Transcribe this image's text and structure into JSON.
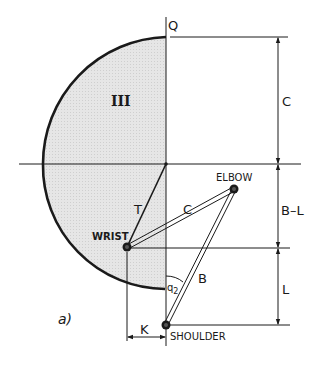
{
  "figure": {
    "panel_label": "a)",
    "region_label": "III",
    "points": {
      "Q": {
        "label": "Q",
        "x": 166,
        "y": 37
      },
      "origin": {
        "x": 166,
        "y": 164
      },
      "wrist": {
        "label": "WRIST",
        "x": 127,
        "y": 247
      },
      "elbow": {
        "label": "ELBOW",
        "x": 234,
        "y": 189
      },
      "shoulder": {
        "label": "SHOULDER",
        "x": 166,
        "y": 325
      }
    },
    "links": {
      "T": "T",
      "C": "C",
      "B": "B"
    },
    "angle_label": "q",
    "angle_sub": "2",
    "dimensions": {
      "top": "C",
      "middle": "B–L",
      "bottom": "L",
      "horizontal": "K"
    },
    "colors": {
      "ink": "#1a1a1a",
      "shade": "#e3e3e3"
    }
  }
}
